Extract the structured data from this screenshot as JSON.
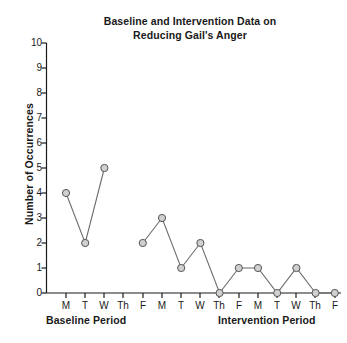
{
  "chart_data": {
    "type": "line",
    "title": "Baseline and Intervention Data on Reducing Gail's Anger",
    "title_line1": "Baseline and Intervention Data on",
    "title_line2": "Reducing Gail's Anger",
    "xlabel": "",
    "ylabel": "Number of Occurrences",
    "ylim": [
      0,
      10
    ],
    "yticks": [
      0,
      1,
      2,
      3,
      4,
      5,
      6,
      7,
      8,
      9,
      10
    ],
    "ytick_labels": [
      "0",
      "1",
      "2",
      "3",
      "4",
      "5",
      "6",
      "7",
      "8",
      "9",
      "10"
    ],
    "categories": [
      "M",
      "T",
      "W",
      "Th",
      "F",
      "M",
      "T",
      "W",
      "Th",
      "F",
      "M",
      "T",
      "W",
      "Th",
      "F"
    ],
    "values": [
      4,
      2,
      5,
      null,
      2,
      3,
      1,
      2,
      0,
      1,
      1,
      0,
      1,
      0,
      0
    ],
    "grid": false,
    "legend": "none",
    "marker": "circle-open-gray",
    "series": [
      {
        "name": "Number of Occurrences",
        "values": [
          4,
          2,
          5,
          null,
          2,
          3,
          1,
          2,
          0,
          1,
          1,
          0,
          1,
          0,
          0
        ]
      }
    ],
    "annotations": [
      {
        "name": "baseline-period",
        "label": "Baseline Period"
      },
      {
        "name": "intervention-period",
        "label": "Intervention Period"
      }
    ],
    "colors": {
      "line": "#6b6b6b",
      "marker_fill": "#d0d0d0",
      "marker_stroke": "#555555",
      "axis": "#1a1a1a",
      "text": "#1a1a1a",
      "background": "#ffffff"
    }
  },
  "periods": {
    "baseline": "Baseline Period",
    "intervention": "Intervention Period"
  }
}
